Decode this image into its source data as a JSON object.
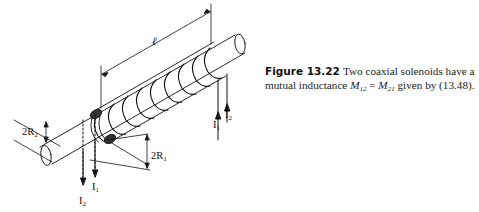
{
  "figure": {
    "labels": {
      "length": "ℓ",
      "two_r2_prefix": "2R",
      "two_r2_sub": "2",
      "two_r1_prefix": "2R",
      "two_r1_sub": "1",
      "i1_prefix": "I",
      "i1_sub": "1",
      "i2_prefix": "I",
      "i2_sub": "2"
    },
    "caption": {
      "label": "Figure 13.22",
      "text_part1": "Two coaxial solenoids have a mutual inductance ",
      "m12": "M",
      "m12_sub": "12",
      "equals": " = ",
      "m21": "M",
      "m21_sub": "21",
      "text_part2": " given by (13.48)."
    }
  }
}
